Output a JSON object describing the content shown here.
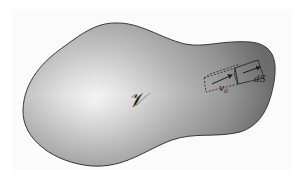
{
  "figure": {
    "volume_label": "𝒱",
    "velocity_label": "v",
    "velocity_subscript": "0",
    "surface_element_label": "dS",
    "colors": {
      "background": "#ffffff",
      "blob_light": "#f4f4f4",
      "blob_mid": "#b9b9b9",
      "blob_dark": "#6e6e6e",
      "outline": "#3a3a3a",
      "ink": "#1e1e1e"
    }
  }
}
